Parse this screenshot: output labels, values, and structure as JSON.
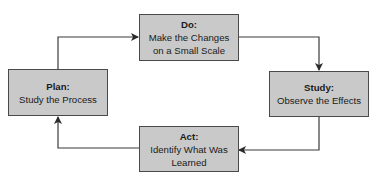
{
  "diagram": {
    "type": "cycle",
    "colors": {
      "box_fill": "#c9c9c9",
      "box_border": "#4a4a4a",
      "line": "#3a3a3a",
      "text": "#1a1a1a"
    },
    "nodes": [
      {
        "id": "do",
        "title": "Do:",
        "line1": "Make the Changes",
        "line2": "on a Small Scale"
      },
      {
        "id": "study",
        "title": "Study:",
        "line1": "Observe the Effects",
        "line2": ""
      },
      {
        "id": "act",
        "title": "Act:",
        "line1": "Identify What Was",
        "line2": "Learned"
      },
      {
        "id": "plan",
        "title": "Plan:",
        "line1": "Study the Process",
        "line2": ""
      }
    ],
    "edges": [
      {
        "from": "plan",
        "to": "do"
      },
      {
        "from": "do",
        "to": "study"
      },
      {
        "from": "study",
        "to": "act"
      },
      {
        "from": "act",
        "to": "plan"
      }
    ]
  }
}
